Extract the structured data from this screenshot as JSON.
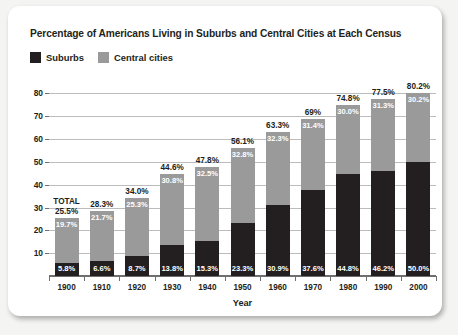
{
  "card": {
    "title": "Percentage of Americans Living in Suburbs and Central Cities at Each Census"
  },
  "legend": {
    "items": [
      {
        "label": "Suburbs",
        "color": "#231f20"
      },
      {
        "label": "Central cities",
        "color": "#9a9a9a"
      }
    ]
  },
  "total_word": "TOTAL",
  "chart_data": {
    "type": "bar",
    "subtype": "stacked",
    "title": "Percentage of Americans Living in Suburbs and Central Cities at Each Census",
    "xlabel": "Year",
    "ylabel": "",
    "ylim": [
      0,
      85
    ],
    "yticks": [
      10,
      20,
      30,
      40,
      50,
      60,
      70,
      80
    ],
    "ytick_labels": [
      "10",
      "20",
      "30",
      "40",
      "50",
      "60",
      "70",
      "80"
    ],
    "grid": true,
    "legend_position": "top-left",
    "categories": [
      "1900",
      "1910",
      "1920",
      "1930",
      "1940",
      "1950",
      "1960",
      "1970",
      "1980",
      "1990",
      "2000"
    ],
    "series": [
      {
        "name": "Suburbs",
        "color": "#231f20",
        "values": [
          5.8,
          6.6,
          8.7,
          13.8,
          15.3,
          23.3,
          30.9,
          37.6,
          44.8,
          46.2,
          50.0
        ],
        "labels": [
          "5.8%",
          "6.6%",
          "8.7%",
          "13.8%",
          "15.3%",
          "23.3%",
          "30.9%",
          "37.6%",
          "44.8%",
          "46.2%",
          "50.0%"
        ]
      },
      {
        "name": "Central cities",
        "color": "#9a9a9a",
        "values": [
          19.7,
          21.7,
          25.3,
          30.8,
          32.5,
          32.8,
          32.3,
          31.4,
          30.0,
          31.3,
          30.2
        ],
        "labels": [
          "19.7%",
          "21.7%",
          "25.3%",
          "30.8%",
          "32.5%",
          "32.8%",
          "32.3%",
          "31.4%",
          "30.0%",
          "31.3%",
          "30.2%"
        ]
      }
    ],
    "totals": [
      25.5,
      28.3,
      34.0,
      44.6,
      47.8,
      56.1,
      63.3,
      69.0,
      74.8,
      77.5,
      80.2
    ],
    "total_labels": [
      "25.5%",
      "28.3%",
      "34.0%",
      "44.6%",
      "47.8%",
      "56.1%",
      "63.3%",
      "69%",
      "74.8%",
      "77.5%",
      "80.2%"
    ]
  }
}
